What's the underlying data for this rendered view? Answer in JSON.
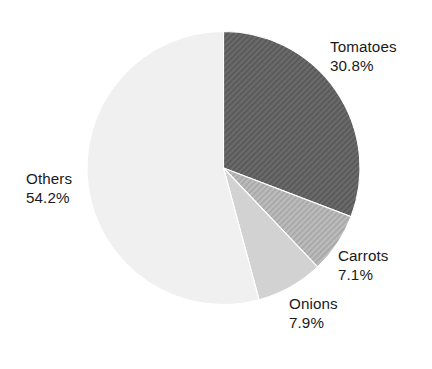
{
  "chart_data": {
    "type": "pie",
    "title": "",
    "subtitle": "",
    "xlabel": "",
    "ylabel": "",
    "legend_position": "none",
    "grid": false,
    "units": "percent",
    "total": 100.0,
    "start_angle_deg": 0,
    "direction": "clockwise",
    "categories": [
      "Tomatoes",
      "Carrots",
      "Onions",
      "Others"
    ],
    "values": [
      30.8,
      7.1,
      7.9,
      54.2
    ],
    "labels": [
      "30.8%",
      "7.1%",
      "7.9%",
      "54.2%"
    ],
    "slices": [
      {
        "name": "Tomatoes",
        "value": 30.8,
        "value_label": "30.8%",
        "color": "#636363",
        "pattern": "diagonal-hatch",
        "start_deg": 0.0,
        "end_deg": 110.88
      },
      {
        "name": "Carrots",
        "value": 7.1,
        "value_label": "7.1%",
        "color": "#b2b2b2",
        "pattern": "diagonal-hatch",
        "start_deg": 110.88,
        "end_deg": 136.44
      },
      {
        "name": "Onions",
        "value": 7.9,
        "value_label": "7.9%",
        "color": "#d2d2d2",
        "pattern": "solid",
        "start_deg": 136.44,
        "end_deg": 164.88
      },
      {
        "name": "Others",
        "value": 54.2,
        "value_label": "54.2%",
        "color": "#f0f0f0",
        "pattern": "solid",
        "start_deg": 164.88,
        "end_deg": 360.0
      }
    ]
  },
  "labels": {
    "tomatoes": {
      "name": "Tomatoes",
      "value": "30.8%"
    },
    "carrots": {
      "name": "Carrots",
      "value": "7.1%"
    },
    "onions": {
      "name": "Onions",
      "value": "7.9%"
    },
    "others": {
      "name": "Others",
      "value": "54.2%"
    }
  },
  "style": {
    "background": "#ffffff",
    "text_color": "#1a1a1a"
  }
}
